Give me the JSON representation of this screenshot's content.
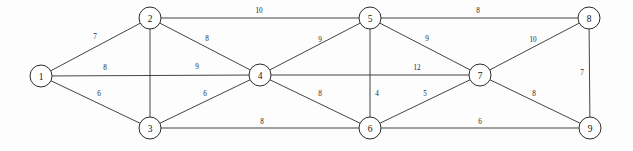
{
  "diagram": {
    "title": "",
    "type": "weighted-undirected-graph",
    "background_color": "#fdfdfd",
    "node_fill": "#ffffff",
    "node_stroke": "#2b2b2b",
    "edge_stroke": "#2e2e2e",
    "label_color": "#141414",
    "node_radius": 11
  },
  "nodes": [
    {
      "id": "1",
      "label": "1",
      "x": 41,
      "y": 76
    },
    {
      "id": "2",
      "label": "2",
      "x": 150,
      "y": 18
    },
    {
      "id": "3",
      "label": "3",
      "x": 150,
      "y": 128
    },
    {
      "id": "4",
      "label": "4",
      "x": 260,
      "y": 75
    },
    {
      "id": "5",
      "label": "5",
      "x": 370,
      "y": 18
    },
    {
      "id": "6",
      "label": "6",
      "x": 370,
      "y": 128
    },
    {
      "id": "7",
      "label": "7",
      "x": 480,
      "y": 75
    },
    {
      "id": "8",
      "label": "8",
      "x": 589,
      "y": 18
    },
    {
      "id": "9",
      "label": "9",
      "x": 590,
      "y": 128
    }
  ],
  "edges": [
    {
      "id": "e-1-2",
      "source": "1",
      "target": "2",
      "weight": "7",
      "lx": 95,
      "ly": 37
    },
    {
      "id": "e-1-4",
      "source": "1",
      "target": "4",
      "weight": "8",
      "lx": 105,
      "ly": 68
    },
    {
      "id": "e-1-4b",
      "source": "1",
      "target": "4",
      "weight": "9",
      "lx": 197,
      "ly": 67
    },
    {
      "id": "e-1-3",
      "source": "1",
      "target": "3",
      "weight": "6",
      "lx": 99,
      "ly": 94
    },
    {
      "id": "e-2-5",
      "source": "2",
      "target": "5",
      "weight": "10",
      "lx": 259,
      "ly": 11
    },
    {
      "id": "e-2-4",
      "source": "2",
      "target": "4",
      "weight": "8",
      "lx": 207,
      "ly": 39
    },
    {
      "id": "e-2-3",
      "source": "2",
      "target": "3",
      "weight": "",
      "lx": 150,
      "ly": 73
    },
    {
      "id": "e-3-4",
      "source": "3",
      "target": "4",
      "weight": "6",
      "lx": 205,
      "ly": 94
    },
    {
      "id": "e-3-6",
      "source": "3",
      "target": "6",
      "weight": "8",
      "lx": 262,
      "ly": 122
    },
    {
      "id": "e-4-5",
      "source": "4",
      "target": "5",
      "weight": "9",
      "lx": 320,
      "ly": 40
    },
    {
      "id": "e-4-6",
      "source": "4",
      "target": "6",
      "weight": "8",
      "lx": 320,
      "ly": 94
    },
    {
      "id": "e-4-7",
      "source": "4",
      "target": "7",
      "weight": "12",
      "lx": 417,
      "ly": 68
    },
    {
      "id": "e-5-6",
      "source": "5",
      "target": "6",
      "weight": "4",
      "lx": 377,
      "ly": 94
    },
    {
      "id": "e-5-7",
      "source": "5",
      "target": "7",
      "weight": "9",
      "lx": 427,
      "ly": 39
    },
    {
      "id": "e-5-8",
      "source": "5",
      "target": "8",
      "weight": "8",
      "lx": 478,
      "ly": 11
    },
    {
      "id": "e-6-7",
      "source": "6",
      "target": "7",
      "weight": "5",
      "lx": 425,
      "ly": 94
    },
    {
      "id": "e-6-9",
      "source": "6",
      "target": "9",
      "weight": "6",
      "lx": 480,
      "ly": 122
    },
    {
      "id": "e-7-8",
      "source": "7",
      "target": "8",
      "weight": "10",
      "lx": 533,
      "ly": 40
    },
    {
      "id": "e-7-9",
      "source": "7",
      "target": "9",
      "weight": "8",
      "lx": 534,
      "ly": 94
    },
    {
      "id": "e-8-9",
      "source": "8",
      "target": "9",
      "weight": "7",
      "lx": 582,
      "ly": 73
    }
  ]
}
